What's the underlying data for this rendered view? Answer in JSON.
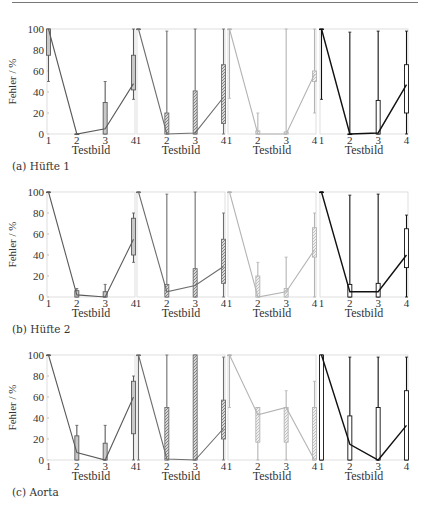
{
  "header_rule": true,
  "chart_data": {
    "type": "boxplot-line",
    "ylabel": "Fehler / %",
    "xlabel": "Testbild",
    "ylim": [
      0,
      100
    ],
    "yticks": [
      0,
      20,
      40,
      60,
      80,
      100
    ],
    "xticks": [
      1,
      2,
      3,
      4
    ],
    "grid": false,
    "series_styles": [
      {
        "name": "method-1",
        "color": "#5a5a5a",
        "pattern": "solid"
      },
      {
        "name": "method-2",
        "color": "#6e6e6e",
        "pattern": "hatched"
      },
      {
        "name": "method-3",
        "color": "#b4b4b4",
        "pattern": "hatched"
      },
      {
        "name": "method-4",
        "color": "#111111",
        "pattern": "solid"
      }
    ],
    "rows": [
      {
        "caption": "(a) Hüfte 1",
        "panels": [
          {
            "median_line": [
              100,
              0,
              5,
              48
            ],
            "boxes": [
              {
                "x": 1,
                "whisker_low": 50,
                "q1": 75,
                "q3": 100,
                "whisker_high": 100
              },
              {
                "x": 2,
                "whisker_low": 0,
                "q1": 0,
                "q3": 0,
                "whisker_high": 0
              },
              {
                "x": 3,
                "whisker_low": 0,
                "q1": 0,
                "q3": 30,
                "whisker_high": 50
              },
              {
                "x": 4,
                "whisker_low": 33,
                "q1": 42,
                "q3": 75,
                "whisker_high": 100
              }
            ]
          },
          {
            "median_line": [
              100,
              0,
              1,
              35
            ],
            "boxes": [
              {
                "x": 1,
                "whisker_low": 100,
                "q1": 100,
                "q3": 100,
                "whisker_high": 100
              },
              {
                "x": 2,
                "whisker_low": 0,
                "q1": 0,
                "q3": 20,
                "whisker_high": 98
              },
              {
                "x": 3,
                "whisker_low": 0,
                "q1": 0,
                "q3": 41,
                "whisker_high": 100
              },
              {
                "x": 4,
                "whisker_low": 0,
                "q1": 10,
                "q3": 66,
                "whisker_high": 100
              }
            ]
          },
          {
            "median_line": [
              100,
              0,
              0,
              57
            ],
            "boxes": [
              {
                "x": 1,
                "whisker_low": 34,
                "q1": 100,
                "q3": 100,
                "whisker_high": 100
              },
              {
                "x": 2,
                "whisker_low": 0,
                "q1": 0,
                "q3": 3,
                "whisker_high": 20
              },
              {
                "x": 3,
                "whisker_low": 0,
                "q1": 0,
                "q3": 2,
                "whisker_high": 100
              },
              {
                "x": 4,
                "whisker_low": 20,
                "q1": 50,
                "q3": 60,
                "whisker_high": 100
              }
            ]
          },
          {
            "median_line": [
              100,
              0,
              1,
              47
            ],
            "boxes": [
              {
                "x": 1,
                "whisker_low": 33,
                "q1": 100,
                "q3": 100,
                "whisker_high": 100
              },
              {
                "x": 2,
                "whisker_low": 0,
                "q1": 0,
                "q3": 0,
                "whisker_high": 97
              },
              {
                "x": 3,
                "whisker_low": 0,
                "q1": 0,
                "q3": 32,
                "whisker_high": 98
              },
              {
                "x": 4,
                "whisker_low": 0,
                "q1": 20,
                "q3": 66,
                "whisker_high": 98
              }
            ]
          }
        ]
      },
      {
        "caption": "(b) Hüfte 2",
        "panels": [
          {
            "median_line": [
              100,
              2,
              0,
              55
            ],
            "boxes": [
              {
                "x": 1,
                "whisker_low": 100,
                "q1": 100,
                "q3": 100,
                "whisker_high": 100
              },
              {
                "x": 2,
                "whisker_low": 0,
                "q1": 0,
                "q3": 6,
                "whisker_high": 8
              },
              {
                "x": 3,
                "whisker_low": 0,
                "q1": 0,
                "q3": 5,
                "whisker_high": 12
              },
              {
                "x": 4,
                "whisker_low": 33,
                "q1": 40,
                "q3": 75,
                "whisker_high": 80
              }
            ]
          },
          {
            "median_line": [
              100,
              5,
              11,
              29
            ],
            "boxes": [
              {
                "x": 1,
                "whisker_low": 100,
                "q1": 100,
                "q3": 100,
                "whisker_high": 100
              },
              {
                "x": 2,
                "whisker_low": 0,
                "q1": 0,
                "q3": 12,
                "whisker_high": 98
              },
              {
                "x": 3,
                "whisker_low": 0,
                "q1": 0,
                "q3": 27,
                "whisker_high": 100
              },
              {
                "x": 4,
                "whisker_low": 0,
                "q1": 13,
                "q3": 55,
                "whisker_high": 80
              }
            ]
          },
          {
            "median_line": [
              100,
              0,
              5,
              45
            ],
            "boxes": [
              {
                "x": 1,
                "whisker_low": 100,
                "q1": 100,
                "q3": 100,
                "whisker_high": 100
              },
              {
                "x": 2,
                "whisker_low": 0,
                "q1": 0,
                "q3": 20,
                "whisker_high": 33
              },
              {
                "x": 3,
                "whisker_low": 0,
                "q1": 0,
                "q3": 8,
                "whisker_high": 38
              },
              {
                "x": 4,
                "whisker_low": 0,
                "q1": 38,
                "q3": 66,
                "whisker_high": 80
              }
            ]
          },
          {
            "median_line": [
              100,
              5,
              5,
              40
            ],
            "boxes": [
              {
                "x": 1,
                "whisker_low": 100,
                "q1": 100,
                "q3": 100,
                "whisker_high": 100
              },
              {
                "x": 2,
                "whisker_low": 0,
                "q1": 0,
                "q3": 12,
                "whisker_high": 97
              },
              {
                "x": 3,
                "whisker_low": 0,
                "q1": 0,
                "q3": 13,
                "whisker_high": 98
              },
              {
                "x": 4,
                "whisker_low": 0,
                "q1": 28,
                "q3": 65,
                "whisker_high": 78
              }
            ]
          }
        ]
      },
      {
        "caption": "(c) Aorta",
        "panels": [
          {
            "median_line": [
              100,
              7,
              0,
              60
            ],
            "boxes": [
              {
                "x": 1,
                "whisker_low": 100,
                "q1": 100,
                "q3": 100,
                "whisker_high": 100
              },
              {
                "x": 2,
                "whisker_low": 0,
                "q1": 0,
                "q3": 23,
                "whisker_high": 33
              },
              {
                "x": 3,
                "whisker_low": 0,
                "q1": 0,
                "q3": 16,
                "whisker_high": 33
              },
              {
                "x": 4,
                "whisker_low": 0,
                "q1": 25,
                "q3": 75,
                "whisker_high": 80
              }
            ]
          },
          {
            "median_line": [
              100,
              1,
              0,
              30
            ],
            "boxes": [
              {
                "x": 1,
                "whisker_low": 0,
                "q1": 100,
                "q3": 100,
                "whisker_high": 100
              },
              {
                "x": 2,
                "whisker_low": 0,
                "q1": 0,
                "q3": 50,
                "whisker_high": 100
              },
              {
                "x": 3,
                "whisker_low": 0,
                "q1": 0,
                "q3": 100,
                "whisker_high": 100
              },
              {
                "x": 4,
                "whisker_low": 0,
                "q1": 20,
                "q3": 57,
                "whisker_high": 98
              }
            ]
          },
          {
            "median_line": [
              100,
              43,
              50,
              0
            ],
            "boxes": [
              {
                "x": 1,
                "whisker_low": 50,
                "q1": 100,
                "q3": 100,
                "whisker_high": 100
              },
              {
                "x": 2,
                "whisker_low": 0,
                "q1": 17,
                "q3": 50,
                "whisker_high": 50
              },
              {
                "x": 3,
                "whisker_low": 0,
                "q1": 17,
                "q3": 50,
                "whisker_high": 66
              },
              {
                "x": 4,
                "whisker_low": 0,
                "q1": 0,
                "q3": 50,
                "whisker_high": 75
              }
            ]
          },
          {
            "median_line": [
              100,
              15,
              0,
              33
            ],
            "boxes": [
              {
                "x": 1,
                "whisker_low": 0,
                "q1": 0,
                "q3": 100,
                "whisker_high": 100
              },
              {
                "x": 2,
                "whisker_low": 0,
                "q1": 0,
                "q3": 42,
                "whisker_high": 98
              },
              {
                "x": 3,
                "whisker_low": 0,
                "q1": 0,
                "q3": 50,
                "whisker_high": 98
              },
              {
                "x": 4,
                "whisker_low": 0,
                "q1": 0,
                "q3": 66,
                "whisker_high": 98
              }
            ]
          }
        ]
      }
    ]
  }
}
